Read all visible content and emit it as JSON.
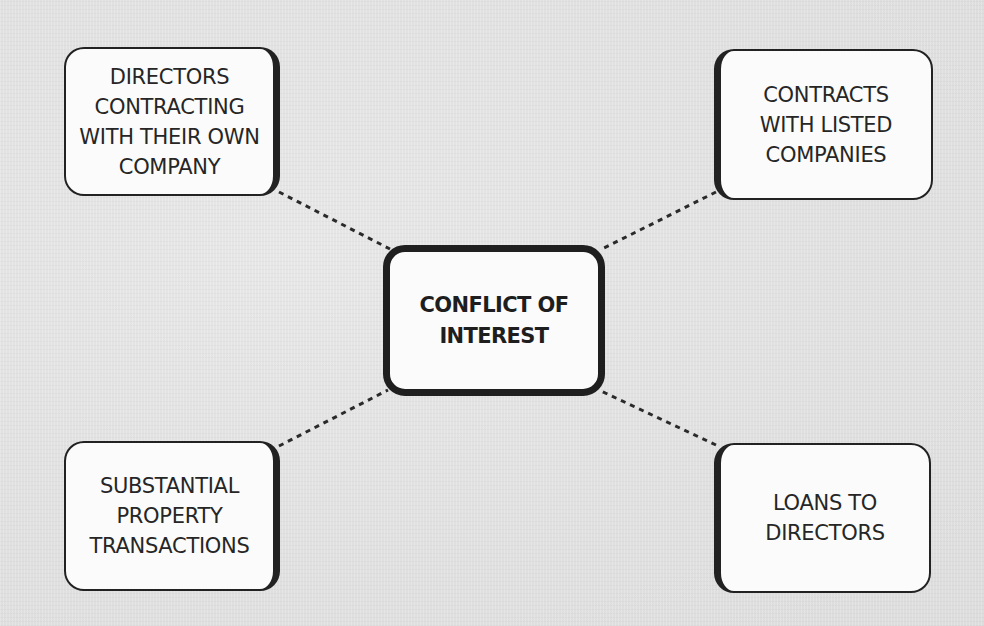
{
  "diagram": {
    "type": "hub-and-spoke",
    "center": {
      "label": "CONFLICT OF\nINTEREST"
    },
    "nodes": [
      {
        "id": "top-left",
        "label": "DIRECTORS\nCONTRACTING\nWITH THEIR OWN\nCOMPANY"
      },
      {
        "id": "top-right",
        "label": "CONTRACTS\nWITH LISTED\nCOMPANIES"
      },
      {
        "id": "bottom-left",
        "label": "SUBSTANTIAL\nPROPERTY\nTRANSACTIONS"
      },
      {
        "id": "bottom-right",
        "label": "LOANS TO\nDIRECTORS"
      }
    ],
    "connector_style": "dashed",
    "colors": {
      "background": "#e4e4e4",
      "box_fill": "#fbfbfb",
      "border": "#222222",
      "text": "#262626"
    }
  }
}
